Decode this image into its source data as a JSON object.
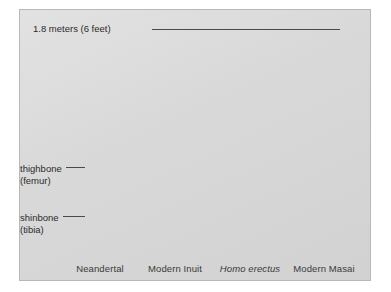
{
  "figure": {
    "kind": "illustration",
    "panel": {
      "background_color": "#dcdcdc",
      "border_color": "#b8b8b8"
    },
    "scale_annotation": {
      "label": "1.8 meters (6 feet)",
      "leader": "horizontal-line-to-tallest-skull"
    },
    "bone_annotations": [
      {
        "name": "thighbone-femur",
        "line1": "thighbone",
        "line2": "(femur)"
      },
      {
        "name": "shinbone-tibia",
        "line1": "shinbone",
        "line2": "(tibia)"
      }
    ],
    "specimens": [
      {
        "caption": "Neandertal",
        "italic": false,
        "relative_height": 0.88,
        "build": "robust"
      },
      {
        "caption": "Modern Inuit",
        "italic": false,
        "relative_height": 0.8,
        "build": "stocky"
      },
      {
        "caption": "Homo erectus",
        "italic": true,
        "relative_height": 0.93,
        "build": "slender"
      },
      {
        "caption": "Modern Masai",
        "italic": false,
        "relative_height": 1.0,
        "build": "tall-slender"
      }
    ],
    "colors": {
      "bone_light": "#f4f2ee",
      "bone_shade": "#b9b6b0",
      "outline": "#6e6c68",
      "body_silhouette": "#c9c9c7",
      "text": "#2b2b2b",
      "leader_line": "#4a4a4a"
    }
  }
}
